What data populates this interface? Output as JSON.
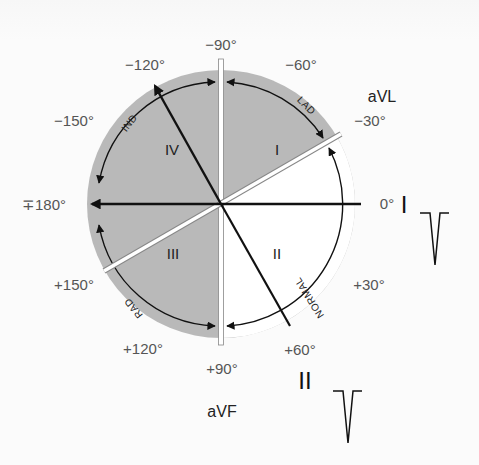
{
  "diagram": {
    "colors": {
      "background": "#fbfbfb",
      "shaded_region": "#b9b9b9",
      "normal_region": "#ffffff",
      "lines": "#111111",
      "divider_bars": "#ffffff",
      "degree_labels": "#555555"
    },
    "degree_labels": {
      "minus90": "−90°",
      "minus120": "−120°",
      "minus60": "−60°",
      "minus150": "−150°",
      "minus30": "−30°",
      "plusminus180": "∓180°",
      "zero": "0°",
      "plus150": "+150°",
      "plus30": "+30°",
      "plus120": "+120°",
      "plus60": "+60°",
      "plus90": "+90°"
    },
    "lead_labels": {
      "avl": "aVL",
      "lead_i": "I",
      "lead_ii": "II",
      "avf": "aVF"
    },
    "quadrants": {
      "q1": "I",
      "q2": "II",
      "q3": "III",
      "q4": "IV"
    },
    "arc_labels": {
      "ind": "IND",
      "lad": "LAD",
      "normal": "NORMAL",
      "rad": "RAD"
    },
    "waveforms": [
      {
        "lead": "I",
        "shape": "negative deflection (QS)"
      },
      {
        "lead": "II",
        "shape": "negative deflection (QS)"
      }
    ],
    "axis_vector_deg": -120
  }
}
